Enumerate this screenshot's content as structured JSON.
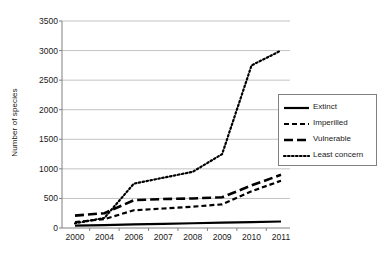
{
  "chart_data": {
    "type": "line",
    "title": "",
    "xlabel": "",
    "ylabel": "Number of species",
    "categories": [
      "2000",
      "2004",
      "2006",
      "2007",
      "2008",
      "2009",
      "2010",
      "2011"
    ],
    "ylim": [
      0,
      3500
    ],
    "ytick_step": 500,
    "yticks": [
      "3500",
      "3000",
      "2500",
      "2000",
      "1500",
      "1000",
      "500",
      "0"
    ],
    "ytick_values": [
      3500,
      3000,
      2500,
      2000,
      1500,
      1000,
      500,
      0
    ],
    "grid": "horizontal",
    "legend_position": "right-middle",
    "series": [
      {
        "name": "Extinct",
        "style": "solid",
        "color": "#000000",
        "values": [
          40,
          50,
          60,
          70,
          80,
          90,
          100,
          110
        ]
      },
      {
        "name": "Imperilled",
        "style": "dashed",
        "color": "#000000",
        "values": [
          100,
          150,
          300,
          330,
          360,
          400,
          620,
          800
        ]
      },
      {
        "name": "Vulnerable",
        "style": "long-dash",
        "color": "#000000",
        "values": [
          210,
          250,
          470,
          490,
          500,
          520,
          720,
          900
        ]
      },
      {
        "name": "Least concern",
        "style": "dotted",
        "color": "#000000",
        "values": [
          80,
          170,
          750,
          850,
          950,
          1250,
          2750,
          3000
        ]
      }
    ]
  },
  "legend": {
    "items": [
      {
        "label": "Extinct"
      },
      {
        "label": "Imperilled"
      },
      {
        "label": "Vulnerable"
      },
      {
        "label": "Least concern"
      }
    ]
  }
}
